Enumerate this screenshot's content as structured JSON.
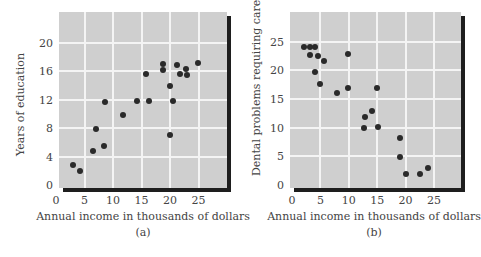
{
  "chart_data": [
    {
      "type": "scatter",
      "panel_label": "(a)",
      "title": "",
      "xlabel": "Annual income in thousands of dollars",
      "ylabel": "Years of education",
      "xlim": [
        0,
        30
      ],
      "ylim": [
        0,
        24
      ],
      "x_ticks": [
        0,
        5,
        10,
        15,
        20,
        25
      ],
      "y_ticks": [
        0,
        4,
        8,
        12,
        16,
        20
      ],
      "grid": true,
      "points": [
        {
          "x": 2.9,
          "y": 2.8
        },
        {
          "x": 4.2,
          "y": 2.0
        },
        {
          "x": 6.5,
          "y": 4.8
        },
        {
          "x": 7.1,
          "y": 7.9
        },
        {
          "x": 8.5,
          "y": 5.5
        },
        {
          "x": 8.6,
          "y": 11.7
        },
        {
          "x": 11.8,
          "y": 9.8
        },
        {
          "x": 14.2,
          "y": 11.8
        },
        {
          "x": 15.8,
          "y": 15.7
        },
        {
          "x": 16.3,
          "y": 11.8
        },
        {
          "x": 18.7,
          "y": 16.2
        },
        {
          "x": 18.8,
          "y": 17.0
        },
        {
          "x": 20.0,
          "y": 13.9
        },
        {
          "x": 20.0,
          "y": 7.1
        },
        {
          "x": 20.6,
          "y": 11.8
        },
        {
          "x": 21.2,
          "y": 16.9
        },
        {
          "x": 21.8,
          "y": 15.7
        },
        {
          "x": 22.8,
          "y": 16.3
        },
        {
          "x": 22.9,
          "y": 15.5
        },
        {
          "x": 24.9,
          "y": 17.2
        }
      ]
    },
    {
      "type": "scatter",
      "panel_label": "(b)",
      "title": "",
      "xlabel": "Annual income in thousands of dollars",
      "ylabel": "Dental problems requiring care",
      "xlim": [
        0,
        30
      ],
      "ylim": [
        0,
        30
      ],
      "x_ticks": [
        0,
        5,
        10,
        15,
        20,
        25
      ],
      "y_ticks": [
        0,
        5,
        10,
        15,
        20,
        25
      ],
      "grid": true,
      "points": [
        {
          "x": 2.1,
          "y": 24.0
        },
        {
          "x": 3.2,
          "y": 24.0
        },
        {
          "x": 4.1,
          "y": 24.0
        },
        {
          "x": 3.1,
          "y": 22.7
        },
        {
          "x": 4.6,
          "y": 22.6
        },
        {
          "x": 5.6,
          "y": 21.6
        },
        {
          "x": 4.1,
          "y": 19.8
        },
        {
          "x": 4.9,
          "y": 17.7
        },
        {
          "x": 9.8,
          "y": 22.8
        },
        {
          "x": 7.9,
          "y": 16.0
        },
        {
          "x": 9.9,
          "y": 16.9
        },
        {
          "x": 15.0,
          "y": 16.9
        },
        {
          "x": 14.1,
          "y": 13.0
        },
        {
          "x": 12.8,
          "y": 11.9
        },
        {
          "x": 12.6,
          "y": 10.0
        },
        {
          "x": 15.1,
          "y": 10.1
        },
        {
          "x": 19.0,
          "y": 8.2
        },
        {
          "x": 19.0,
          "y": 4.9
        },
        {
          "x": 20.1,
          "y": 2.0
        },
        {
          "x": 22.6,
          "y": 2.0
        },
        {
          "x": 23.9,
          "y": 3.0
        }
      ]
    }
  ],
  "panels": [
    {
      "label": "(a)",
      "xlabel": "Annual income in thousands of dollars",
      "ylabel": "Years of education"
    },
    {
      "label": "(b)",
      "xlabel": "Annual income in thousands of dollars",
      "ylabel": "Dental problems requiring care"
    }
  ],
  "colors": {
    "plot_bg": "#cfcfcf",
    "grid": "#f4f4f4",
    "point": "#2a2a2a",
    "shadow": "#1e1e1e"
  }
}
